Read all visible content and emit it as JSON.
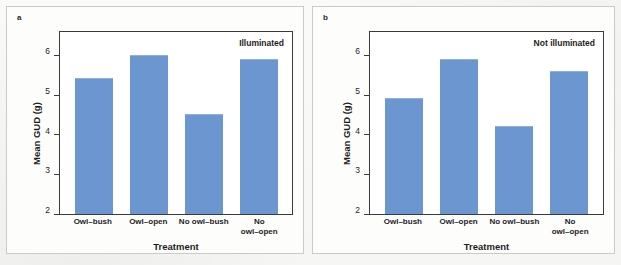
{
  "figure": {
    "background": "#fbfbfa",
    "bar_color": "#6b96cf",
    "axis_color": "#3b3b3b"
  },
  "chart_data": [
    {
      "type": "bar",
      "panel_label": "a",
      "title": "",
      "annotation": "Illuminated",
      "categories": [
        "Owl–bush",
        "Owl–open",
        "No owl–bush",
        "No\nowl–open"
      ],
      "values": [
        5.4,
        6.0,
        4.5,
        5.9
      ],
      "xlabel": "Treatment",
      "ylabel": "Mean GUD (g)",
      "ylim": [
        2,
        6.6
      ],
      "yticks": [
        2,
        3,
        4,
        5,
        6
      ],
      "ytick_labels": [
        "2",
        "3",
        "4",
        "5",
        "6"
      ],
      "grid": false,
      "legend": "none"
    },
    {
      "type": "bar",
      "panel_label": "b",
      "title": "",
      "annotation": "Not illuminated",
      "categories": [
        "Owl–bush",
        "Owl–open",
        "No owl–bush",
        "No\nowl–open"
      ],
      "values": [
        4.9,
        5.9,
        4.2,
        5.6
      ],
      "xlabel": "Treatment",
      "ylabel": "Mean GUD (g)",
      "ylim": [
        2,
        6.6
      ],
      "yticks": [
        2,
        3,
        4,
        5,
        6
      ],
      "ytick_labels": [
        "2",
        "3",
        "4",
        "5",
        "6"
      ],
      "grid": false,
      "legend": "none"
    }
  ]
}
